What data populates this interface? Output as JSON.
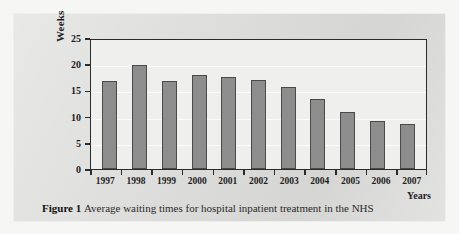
{
  "figure": {
    "label": "Figure 1",
    "caption": "Average waiting times for hospital inpatient treatment in the NHS"
  },
  "chart_data": {
    "type": "bar",
    "title": "",
    "xlabel": "Years",
    "ylabel": "Weeks",
    "categories": [
      "1997",
      "1998",
      "1999",
      "2000",
      "2001",
      "2002",
      "2003",
      "2004",
      "2005",
      "2006",
      "2007"
    ],
    "values": [
      17.0,
      20.2,
      17.1,
      18.3,
      17.8,
      17.3,
      15.9,
      13.5,
      11.0,
      9.4,
      8.8
    ],
    "ylim": [
      0,
      25
    ],
    "yticks": [
      0,
      5,
      10,
      15,
      20,
      25
    ],
    "ytick_labels": [
      "0",
      "5",
      "10",
      "15",
      "20",
      "25"
    ],
    "grid": true,
    "legend": false,
    "bar_color": "#8d8d8d",
    "bar_edge_color": "#4a4a4a",
    "plot_background": "#efefed",
    "axis_color": "#2b2b2b"
  }
}
